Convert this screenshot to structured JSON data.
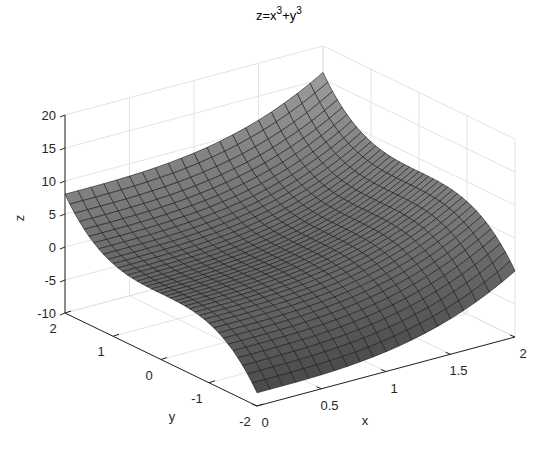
{
  "figure": {
    "title_base": "z=x",
    "title_sup1": "3",
    "title_mid": "+y",
    "title_sup2": "3"
  },
  "chart_data": {
    "type": "surface",
    "function": "z = x^3 + y^3",
    "xlabel": "x",
    "ylabel": "y",
    "zlabel": "z",
    "xlim": [
      0,
      2
    ],
    "ylim": [
      -2,
      2
    ],
    "zlim": [
      -10,
      20
    ],
    "x_ticks": [
      "0",
      "0.5",
      "1",
      "1.5",
      "2"
    ],
    "y_ticks": [
      "-2",
      "-1",
      "0",
      "1",
      "2"
    ],
    "z_ticks": [
      "-10",
      "-5",
      "0",
      "5",
      "10",
      "15",
      "20"
    ],
    "grid": true,
    "mesh": {
      "nx": 21,
      "ny": 41
    },
    "colors": {
      "face_light": "#9a9a9a",
      "face_dark": "#2e2e2e",
      "edge": "#1a1a1a",
      "axis": "#262626",
      "grid": "#e3e3e3"
    },
    "sample_points": [
      {
        "x": 0,
        "y": -2,
        "z": -8
      },
      {
        "x": 0,
        "y": 2,
        "z": 8
      },
      {
        "x": 2,
        "y": -2,
        "z": 0
      },
      {
        "x": 2,
        "y": 2,
        "z": 16
      },
      {
        "x": 1,
        "y": 0,
        "z": 1
      }
    ]
  }
}
